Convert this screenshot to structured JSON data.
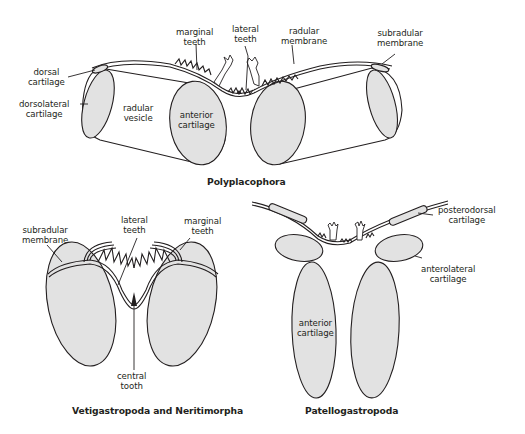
{
  "figure": {
    "colors": {
      "outline": "#231f20",
      "cartilage_fill": "#e2e2e2",
      "vesicle_fill": "#ffffff",
      "background": "#ffffff"
    }
  },
  "panels": {
    "polyplacophora": {
      "title": "Polyplacophora",
      "labels": {
        "marginal_teeth": "marginal\nteeth",
        "lateral_teeth": "lateral\nteeth",
        "radular_membrane": "radular\nmembrane",
        "subradular_membrane": "subradular\nmembrane",
        "dorsal_cartilage": "dorsal\ncartilage",
        "dorsolateral_cartilage": "dorsolateral\ncartilage",
        "radular_vesicle": "radular\nvesicle",
        "anterior_cartilage": "anterior\ncartilage"
      }
    },
    "vetigastropoda": {
      "title": "Vetigastropoda and Neritimorpha",
      "labels": {
        "subradular_membrane": "subradular\nmembrane",
        "lateral_teeth": "lateral\nteeth",
        "marginal_teeth": "marginal\nteeth",
        "central_tooth": "central\ntooth"
      }
    },
    "patellogastropoda": {
      "title": "Patellogastropoda",
      "labels": {
        "posterodorsal_cartilage": "posterodorsal\ncartilage",
        "anterolateral_cartilage": "anterolateral\ncartilage",
        "anterior_cartilage": "anterior\ncartilage"
      }
    }
  }
}
